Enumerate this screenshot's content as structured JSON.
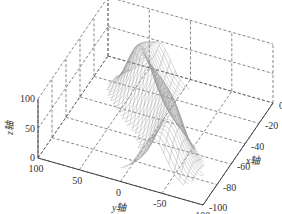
{
  "chart_data": {
    "type": "surface3d",
    "title": "",
    "xlabel": "x轴",
    "ylabel": "y轴",
    "zlabel": "z轴",
    "xlim": [
      -100,
      0
    ],
    "ylim": [
      -100,
      100
    ],
    "zlim": [
      0,
      100
    ],
    "x_ticks": [
      "0",
      "-20",
      "-40",
      "-60",
      "-80",
      "-100"
    ],
    "x_tick_values": [
      0,
      -20,
      -40,
      -60,
      -80,
      -100
    ],
    "y_ticks": [
      "100",
      "50",
      "0",
      "-50",
      "-100"
    ],
    "y_tick_values": [
      100,
      50,
      0,
      -50,
      -100
    ],
    "z_ticks": [
      "0",
      "50",
      "100"
    ],
    "z_tick_values": [
      0,
      50,
      100
    ],
    "grid": true,
    "grid_style": "dashed",
    "line_color": "#9a9a9a"
  }
}
